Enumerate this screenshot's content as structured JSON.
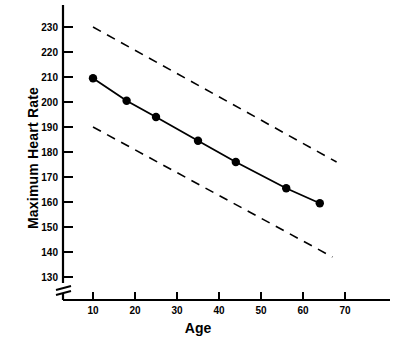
{
  "chart_data": {
    "type": "line",
    "title": "",
    "xlabel": "Age",
    "ylabel": "Maximum Heart Rate",
    "xlim": [
      0,
      78
    ],
    "ylim": [
      125,
      235
    ],
    "xticks": [
      10,
      20,
      30,
      40,
      50,
      60,
      70
    ],
    "yticks": [
      130,
      140,
      150,
      160,
      170,
      180,
      190,
      200,
      210,
      220,
      230
    ],
    "grid": false,
    "legend": null,
    "axis_break": "y-axis break below 130",
    "series": [
      {
        "name": "Mean maximum heart rate",
        "style": "solid-with-markers",
        "color": "#000000",
        "x": [
          10,
          18,
          25,
          35,
          44,
          56,
          64
        ],
        "values": [
          209.5,
          200.5,
          194,
          184.5,
          176,
          165.5,
          159.5
        ]
      },
      {
        "name": "Upper limit",
        "style": "dashed",
        "color": "#000000",
        "x": [
          10,
          68
        ],
        "values": [
          230,
          176
        ]
      },
      {
        "name": "Lower limit",
        "style": "dashed",
        "color": "#000000",
        "x": [
          10,
          67
        ],
        "values": [
          190,
          138
        ]
      }
    ]
  },
  "axes": {
    "x_tick_labels": [
      "10",
      "20",
      "30",
      "40",
      "50",
      "60",
      "70"
    ],
    "y_tick_labels": [
      "130",
      "140",
      "150",
      "160",
      "170",
      "180",
      "190",
      "200",
      "210",
      "220",
      "230"
    ],
    "x_axis_title": "Age",
    "y_axis_title": "Maximum Heart Rate"
  },
  "colors": {
    "ink": "#000000",
    "background": "#ffffff"
  }
}
